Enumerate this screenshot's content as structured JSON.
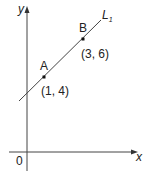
{
  "diagram": {
    "type": "coordinate-geometry",
    "axes": {
      "x_label": "x",
      "y_label": "y",
      "origin_label": "0"
    },
    "line": {
      "name": "L",
      "subscript": "1"
    },
    "points": [
      {
        "name": "A",
        "coords": "(1, 4)",
        "x": 1,
        "y": 4
      },
      {
        "name": "B",
        "coords": "(3, 6)",
        "x": 3,
        "y": 6
      }
    ],
    "colors": {
      "stroke": "#333333",
      "text": "#222222",
      "background": "#ffffff"
    }
  }
}
